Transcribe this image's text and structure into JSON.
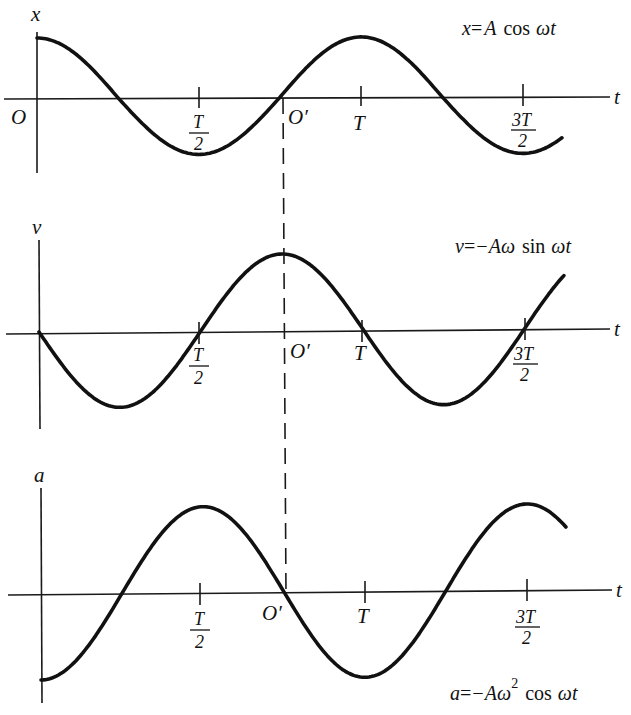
{
  "shared_marker": {
    "label": "O′",
    "note": "dashed line at t = 3T/4 linking the three graphs"
  },
  "panels": [
    {
      "id": "displacement",
      "y_label": "x",
      "x_label": "t",
      "origin_label": "O",
      "equation": {
        "lhs": "x",
        "eq": "=",
        "rhs_coef": "A",
        "func": "cos",
        "arg": "ωt",
        "full": "x = A cos ωt"
      },
      "ticks": [
        {
          "label_num": "T",
          "label_den": "2",
          "value": 0.5
        },
        {
          "label": "O′",
          "value": 0.75
        },
        {
          "label": "T",
          "value": 1.0
        },
        {
          "label_num": "3T",
          "label_den": "2",
          "value": 1.5
        }
      ]
    },
    {
      "id": "velocity",
      "y_label": "v",
      "x_label": "t",
      "equation": {
        "lhs": "v",
        "eq": "=",
        "rhs_coef": "−Aω",
        "func": "sin",
        "arg": "ωt",
        "full": "v = −Aω sin ωt"
      },
      "ticks": [
        {
          "label_num": "T",
          "label_den": "2",
          "value": 0.5
        },
        {
          "label": "O′",
          "value": 0.75
        },
        {
          "label": "T",
          "value": 1.0
        },
        {
          "label_num": "3T",
          "label_den": "2",
          "value": 1.5
        }
      ]
    },
    {
      "id": "acceleration",
      "y_label": "a",
      "x_label": "t",
      "equation": {
        "lhs": "a",
        "eq": "=",
        "rhs_coef": "−Aω",
        "sup": "2",
        "func": "cos",
        "arg": "ωt",
        "full": "a = −Aω² cos ωt"
      },
      "ticks": [
        {
          "label_num": "T",
          "label_den": "2",
          "value": 0.5
        },
        {
          "label": "O′",
          "value": 0.75
        },
        {
          "label": "T",
          "value": 1.0
        },
        {
          "label_num": "3T",
          "label_den": "2",
          "value": 1.5
        }
      ]
    }
  ],
  "chart_data": [
    {
      "type": "line",
      "title": "x = A cos ωt",
      "xlabel": "t",
      "ylabel": "x",
      "x_unit": "T (period)",
      "x_range": [
        0,
        1.62
      ],
      "y_range": [
        -1,
        1
      ],
      "function": "cos(2πt/T)",
      "series": [
        {
          "name": "x",
          "x": [
            0,
            0.25,
            0.5,
            0.75,
            1.0,
            1.25,
            1.5,
            1.62
          ],
          "values": [
            1,
            0,
            -1,
            0,
            1,
            0,
            -1,
            -0.73
          ]
        }
      ],
      "x_ticks": [
        "T/2",
        "O′",
        "T",
        "3T/2"
      ],
      "grid": false
    },
    {
      "type": "line",
      "title": "v = −Aω sin ωt",
      "xlabel": "t",
      "ylabel": "v",
      "x_unit": "T (period)",
      "x_range": [
        0,
        1.62
      ],
      "y_range": [
        -1,
        1
      ],
      "function": "-sin(2πt/T)",
      "series": [
        {
          "name": "v",
          "x": [
            0,
            0.25,
            0.5,
            0.75,
            1.0,
            1.25,
            1.5,
            1.62
          ],
          "values": [
            0,
            -1,
            0,
            1,
            0,
            -1,
            0,
            0.68
          ]
        }
      ],
      "x_ticks": [
        "T/2",
        "O′",
        "T",
        "3T/2"
      ],
      "grid": false
    },
    {
      "type": "line",
      "title": "a = −Aω² cos ωt",
      "xlabel": "t",
      "ylabel": "a",
      "x_unit": "T (period)",
      "x_range": [
        0,
        1.62
      ],
      "y_range": [
        -1,
        1
      ],
      "function": "-cos(2πt/T)",
      "series": [
        {
          "name": "a",
          "x": [
            0,
            0.25,
            0.5,
            0.75,
            1.0,
            1.25,
            1.5,
            1.62
          ],
          "values": [
            -1,
            0,
            1,
            0,
            -1,
            0,
            1,
            0.73
          ]
        }
      ],
      "x_ticks": [
        "T/2",
        "O′",
        "T",
        "3T/2"
      ],
      "grid": false
    }
  ],
  "geometry": {
    "period_px": 324,
    "panels": [
      {
        "x0": 37,
        "axis_y": 98,
        "amp_up": 60,
        "amp_down": 57,
        "yaxis_top": 36,
        "yaxis_bottom": 173,
        "xaxis_left": 4,
        "xaxis_right": 610,
        "t_end": 1.62,
        "phase": 0,
        "sign": 1
      },
      {
        "x0": 39,
        "axis_y": 332,
        "amp_up": 76,
        "amp_down": 76,
        "yaxis_top": 240,
        "yaxis_bottom": 428,
        "xaxis_left": 6,
        "xaxis_right": 610,
        "t_end": 1.62,
        "phase": 0.25,
        "sign": 1
      },
      {
        "x0": 41,
        "axis_y": 594,
        "amp_up": 86,
        "amp_down": 86,
        "yaxis_top": 488,
        "yaxis_bottom": 703,
        "xaxis_left": 8,
        "xaxis_right": 612,
        "t_end": 1.62,
        "phase": 0,
        "sign": -1
      }
    ],
    "dashed": {
      "x1": 283,
      "y1": 98,
      "x2": 286,
      "y2": 596
    }
  }
}
